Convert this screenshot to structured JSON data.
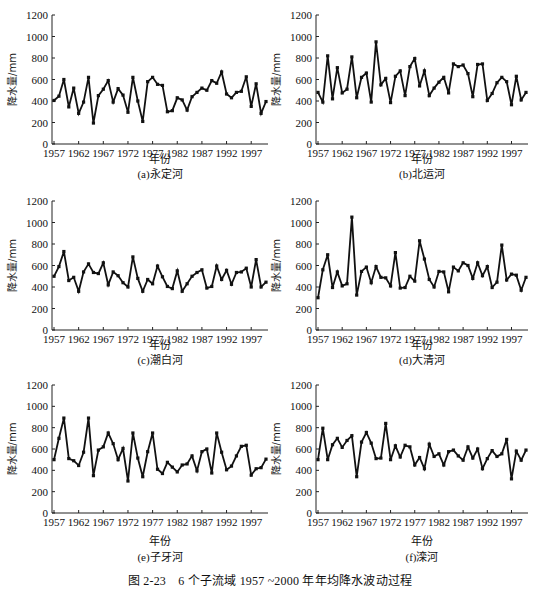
{
  "figure": {
    "caption": "图 2-23　6 个子流域 1957 ~2000 年年均降水波动过程"
  },
  "chart_data": [
    {
      "id": "a",
      "type": "line",
      "title": "(a)永定河",
      "xlabel": "年份",
      "ylabel": "降水量/mm",
      "ylim": [
        0,
        1200
      ],
      "yticks": [
        0,
        200,
        400,
        600,
        800,
        1000,
        1200
      ],
      "xticks": [
        1957,
        1962,
        1967,
        1972,
        1977,
        1982,
        1987,
        1992,
        1997
      ],
      "grid": false,
      "x_start": 1957,
      "x_end": 2000,
      "values": [
        405,
        445,
        600,
        345,
        520,
        285,
        390,
        620,
        195,
        450,
        510,
        590,
        390,
        515,
        455,
        295,
        620,
        400,
        210,
        580,
        620,
        555,
        545,
        300,
        310,
        430,
        410,
        315,
        440,
        480,
        520,
        500,
        590,
        565,
        670,
        465,
        430,
        480,
        490,
        625,
        350,
        560,
        285,
        395
      ]
    },
    {
      "id": "b",
      "type": "line",
      "title": "(b)北运河",
      "xlabel": "年份",
      "ylabel": "降水量/mm",
      "ylim": [
        0,
        1200
      ],
      "yticks": [
        0,
        200,
        400,
        600,
        800,
        1000,
        1200
      ],
      "xticks": [
        1957,
        1962,
        1967,
        1972,
        1977,
        1982,
        1987,
        1992,
        1997
      ],
      "grid": false,
      "x_start": 1957,
      "x_end": 2000,
      "values": [
        480,
        390,
        820,
        420,
        710,
        475,
        510,
        810,
        430,
        620,
        660,
        390,
        950,
        550,
        610,
        385,
        630,
        680,
        450,
        720,
        795,
        540,
        680,
        450,
        520,
        575,
        620,
        475,
        745,
        720,
        735,
        655,
        440,
        740,
        745,
        405,
        470,
        570,
        620,
        580,
        365,
        630,
        410,
        480
      ]
    },
    {
      "id": "c",
      "type": "line",
      "title": "(c)潮白河",
      "xlabel": "年份",
      "ylabel": "降水量/mm",
      "ylim": [
        0,
        1200
      ],
      "yticks": [
        0,
        200,
        400,
        600,
        800,
        1000,
        1200
      ],
      "xticks": [
        1957,
        1962,
        1967,
        1972,
        1977,
        1982,
        1987,
        1992,
        1997
      ],
      "grid": false,
      "x_start": 1957,
      "x_end": 2000,
      "values": [
        500,
        590,
        730,
        460,
        490,
        360,
        540,
        615,
        535,
        525,
        625,
        420,
        540,
        505,
        440,
        400,
        680,
        480,
        360,
        470,
        430,
        595,
        495,
        405,
        385,
        550,
        360,
        430,
        500,
        535,
        560,
        390,
        405,
        595,
        470,
        555,
        425,
        535,
        540,
        575,
        400,
        655,
        400,
        445
      ]
    },
    {
      "id": "d",
      "type": "line",
      "title": "(d)大清河",
      "xlabel": "年份",
      "ylabel": "降水量/mm",
      "ylim": [
        0,
        1200
      ],
      "yticks": [
        0,
        200,
        400,
        600,
        800,
        1000,
        1200
      ],
      "xticks": [
        1957,
        1962,
        1967,
        1972,
        1977,
        1982,
        1987,
        1992,
        1997
      ],
      "grid": false,
      "x_start": 1957,
      "x_end": 2000,
      "values": [
        300,
        560,
        700,
        395,
        540,
        410,
        430,
        1050,
        325,
        545,
        585,
        440,
        590,
        490,
        485,
        410,
        720,
        390,
        395,
        500,
        455,
        830,
        660,
        470,
        400,
        545,
        540,
        355,
        585,
        550,
        625,
        600,
        480,
        625,
        505,
        590,
        395,
        445,
        790,
        465,
        520,
        510,
        370,
        490
      ]
    },
    {
      "id": "e",
      "type": "line",
      "title": "(e)子牙河",
      "xlabel": "年份",
      "ylabel": "降水量/mm",
      "ylim": [
        0,
        1200
      ],
      "yticks": [
        0,
        200,
        400,
        600,
        800,
        1000,
        1200
      ],
      "xticks": [
        1957,
        1962,
        1967,
        1972,
        1977,
        1982,
        1987,
        1992,
        1997
      ],
      "grid": false,
      "x_start": 1957,
      "x_end": 2000,
      "values": [
        500,
        700,
        890,
        510,
        490,
        445,
        570,
        890,
        350,
        590,
        620,
        750,
        650,
        500,
        605,
        300,
        750,
        515,
        340,
        575,
        750,
        410,
        370,
        475,
        430,
        385,
        450,
        460,
        535,
        395,
        575,
        600,
        375,
        750,
        570,
        405,
        440,
        535,
        625,
        635,
        355,
        415,
        425,
        505
      ]
    },
    {
      "id": "f",
      "type": "line",
      "title": "(f)滦河",
      "xlabel": "年份",
      "ylabel": "降水量/mm",
      "ylim": [
        0,
        1200
      ],
      "yticks": [
        0,
        200,
        400,
        600,
        800,
        1000,
        1200
      ],
      "xticks": [
        1957,
        1962,
        1967,
        1972,
        1977,
        1982,
        1987,
        1992,
        1997
      ],
      "grid": false,
      "x_start": 1957,
      "x_end": 2000,
      "values": [
        500,
        795,
        500,
        640,
        700,
        615,
        680,
        725,
        340,
        665,
        755,
        655,
        510,
        515,
        840,
        500,
        630,
        525,
        635,
        620,
        450,
        520,
        415,
        645,
        530,
        555,
        450,
        575,
        590,
        535,
        495,
        620,
        515,
        600,
        415,
        510,
        585,
        530,
        555,
        690,
        320,
        580,
        495,
        590
      ]
    }
  ]
}
